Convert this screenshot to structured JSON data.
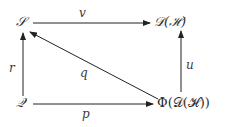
{
  "diagram": {
    "type": "commutative-diagram",
    "nodes": {
      "S": {
        "label": "𝒮"
      },
      "D": {
        "label": "𝒟(ℋ)"
      },
      "Q": {
        "label": "𝒬"
      },
      "Phi": {
        "label": "Φ(𝒟(ℋ))"
      }
    },
    "arrows": {
      "v": {
        "label": "v",
        "from": "S",
        "to": "D"
      },
      "r": {
        "label": "r",
        "from": "Q",
        "to": "S"
      },
      "q": {
        "label": "q",
        "from": "Phi",
        "to": "S"
      },
      "u": {
        "label": "u",
        "from": "Phi",
        "to": "D"
      },
      "p": {
        "label": "p",
        "from": "Q",
        "to": "Phi"
      }
    },
    "colors": {
      "stroke": "#222222",
      "background": "#ffffff"
    }
  }
}
